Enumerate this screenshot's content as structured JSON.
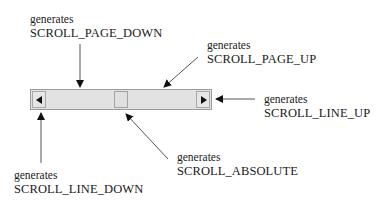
{
  "diagram": {
    "scrollbar": {
      "orientation": "horizontal",
      "parts": [
        "line-down-button",
        "page-down-track",
        "thumb",
        "page-up-track",
        "line-up-button"
      ],
      "colors": {
        "track": "#e2e2e2",
        "border": "#9a9a9a",
        "arrow": "#111111"
      }
    },
    "annotations": [
      {
        "id": "page_down",
        "prefix": "generates",
        "event": "SCROLL_PAGE_DOWN",
        "target": "track left of thumb"
      },
      {
        "id": "page_up",
        "prefix": "generates",
        "event": "SCROLL_PAGE_UP",
        "target": "track right of thumb"
      },
      {
        "id": "line_up",
        "prefix": "generates",
        "event": "SCROLL_LINE_UP",
        "target": "right arrow button"
      },
      {
        "id": "absolute",
        "prefix": "generates",
        "event": "SCROLL_ABSOLUTE",
        "target": "thumb"
      },
      {
        "id": "line_down",
        "prefix": "generates",
        "event": "SCROLL_LINE_DOWN",
        "target": "left arrow button"
      }
    ],
    "labels": {
      "page_down": {
        "line1": "generates",
        "line2": "SCROLL_PAGE_DOWN"
      },
      "page_up": {
        "line1": "generates",
        "line2": "SCROLL_PAGE_UP"
      },
      "line_up": {
        "line1": "generates",
        "line2": "SCROLL_LINE_UP"
      },
      "absolute": {
        "line1": "generates",
        "line2": "SCROLL_ABSOLUTE"
      },
      "line_down": {
        "line1": "generates",
        "line2": "SCROLL_LINE_DOWN"
      }
    }
  }
}
